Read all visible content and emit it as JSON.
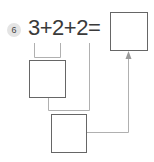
{
  "problem": {
    "number": "6",
    "equation": "3+2+2=",
    "terms": [
      "3",
      "2",
      "2"
    ],
    "operators": [
      "+",
      "+",
      "="
    ]
  },
  "boxes": {
    "result_box": {
      "value": ""
    },
    "first_sum_box": {
      "value": ""
    },
    "second_sum_box": {
      "value": ""
    }
  },
  "colors": {
    "text": "#3a3a3a",
    "box_border": "#666666",
    "connector": "#aaaaaa",
    "badge_bg": "#e4e4e4"
  }
}
